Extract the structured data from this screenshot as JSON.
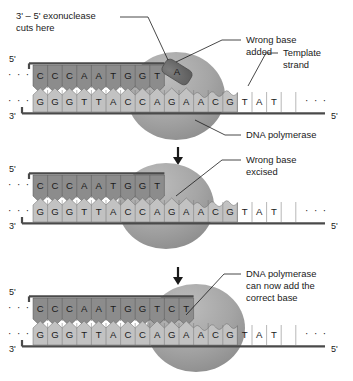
{
  "figure": {
    "dots": "· · ·",
    "ellipsis_right": "· · ·"
  },
  "colors": {
    "new_strand": "#8c8c8c",
    "template_strand": "#c2c2c2",
    "polymerase": "#a3a3a3",
    "polymerase_dark": "#8f8f8f",
    "wrong_base": "#6e6e6e",
    "backbone": "#4a4a4a",
    "text": "#1a1a1a"
  },
  "panels": [
    {
      "id": "panel-1",
      "name": "wrong-base-added",
      "end_labels": {
        "top_left": "5'",
        "bottom_left": "3'",
        "bottom_right": "5'"
      },
      "new_strand_bases": [
        "C",
        "C",
        "C",
        "A",
        "A",
        "T",
        "G",
        "G",
        "T"
      ],
      "template_strand_bases": [
        "G",
        "G",
        "G",
        "T",
        "T",
        "A",
        "C",
        "C",
        "A",
        "G",
        "A",
        "A",
        "C",
        "G",
        "T",
        "A",
        "T"
      ],
      "wrong_base": "A",
      "callouts": [
        {
          "name": "exonuclease-callout",
          "line1": "3' – 5' exonuclease",
          "line2": "cuts here"
        },
        {
          "name": "wrong-base-callout",
          "line1": "Wrong base",
          "line2": "added"
        },
        {
          "name": "template-strand-callout",
          "line1": "Template",
          "line2": "strand"
        },
        {
          "name": "dna-polymerase-callout",
          "line1": "DNA polymerase",
          "line2": ""
        }
      ]
    },
    {
      "id": "panel-2",
      "name": "wrong-base-excised",
      "end_labels": {
        "top_left": "5'",
        "bottom_left": "3'",
        "bottom_right": "5'"
      },
      "new_strand_bases": [
        "C",
        "C",
        "C",
        "A",
        "A",
        "T",
        "G",
        "G",
        "T"
      ],
      "template_strand_bases": [
        "G",
        "G",
        "G",
        "T",
        "T",
        "A",
        "C",
        "C",
        "A",
        "G",
        "A",
        "A",
        "C",
        "G",
        "T",
        "A",
        "T"
      ],
      "wrong_base": "",
      "callouts": [
        {
          "name": "wrong-base-excised-callout",
          "line1": "Wrong base",
          "line2": "excised"
        }
      ]
    },
    {
      "id": "panel-3",
      "name": "correct-base-added",
      "end_labels": {
        "top_left": "5'",
        "bottom_left": "3'",
        "bottom_right": "5'"
      },
      "new_strand_bases": [
        "C",
        "C",
        "C",
        "A",
        "A",
        "T",
        "G",
        "G",
        "T",
        "C",
        "T"
      ],
      "template_strand_bases": [
        "G",
        "G",
        "G",
        "T",
        "T",
        "A",
        "C",
        "C",
        "A",
        "G",
        "A",
        "A",
        "C",
        "G",
        "T",
        "A",
        "T"
      ],
      "wrong_base": "",
      "callouts": [
        {
          "name": "polymerase-adds-callout",
          "line1": "DNA polymerase",
          "line2": "can now add the",
          "line3": "correct base"
        }
      ]
    }
  ],
  "arrows": [
    {
      "name": "step-arrow-1"
    },
    {
      "name": "step-arrow-2"
    }
  ]
}
